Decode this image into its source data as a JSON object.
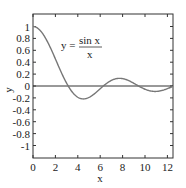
{
  "chart_data": {
    "type": "line",
    "title": "",
    "annotation": {
      "lhs": "y =",
      "numerator": "sin x",
      "denominator": "x"
    },
    "xlabel": "x",
    "ylabel": "y",
    "xlim": [
      0,
      12.5
    ],
    "ylim": [
      -1.15,
      1.1
    ],
    "xticks": [
      "0",
      "2",
      "4",
      "6",
      "8",
      "10",
      "12"
    ],
    "yticks": [
      "1",
      "0.8",
      "0.6",
      "0.4",
      "0.2",
      "0",
      "-0.2",
      "-0.4",
      "-0.6",
      "-0.8",
      "-1"
    ],
    "grid": false,
    "series": [
      {
        "name": "sin x / x",
        "color": "#777777",
        "x": [
          0,
          1,
          2,
          3,
          3.1416,
          4,
          4.4934,
          5,
          6,
          6.2832,
          7,
          7.7253,
          8,
          9,
          9.4248,
          10,
          10.9041,
          11,
          12,
          12.5
        ],
        "y": [
          1,
          0.841,
          0.455,
          0.047,
          0,
          -0.189,
          -0.217,
          -0.192,
          -0.047,
          0,
          0.094,
          0.128,
          0.124,
          0.046,
          0,
          -0.054,
          -0.091,
          -0.091,
          -0.045,
          -0.005
        ]
      }
    ],
    "zero_line": true
  }
}
